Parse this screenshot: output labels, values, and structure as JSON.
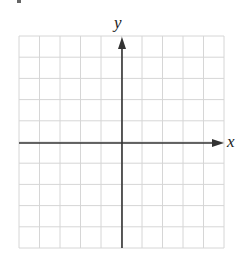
{
  "diagram": {
    "type": "coordinate-grid",
    "grid": {
      "columns": 10,
      "rows": 10,
      "left": 19,
      "top": 36,
      "right": 224,
      "bottom": 248,
      "line_color": "#d6d6d6"
    },
    "axes": {
      "color": "#333333",
      "origin": {
        "x": 122,
        "y": 143
      },
      "x_axis": {
        "label": "x",
        "arrow": "right"
      },
      "y_axis": {
        "label": "y",
        "arrow": "up"
      }
    }
  }
}
